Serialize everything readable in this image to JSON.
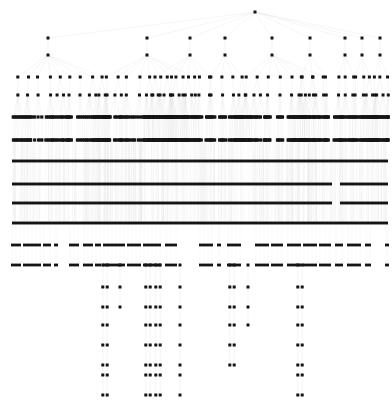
{
  "figure": {
    "type": "node-link-tree",
    "orientation": "top-down",
    "width": 392,
    "height": 407,
    "background_color": "#ffffff",
    "node_color": "#141414",
    "node_shape": "square",
    "node_size_px": 3,
    "edge_color": "#d8d8d8",
    "edge_width_px": 0.6,
    "edge_opacity": 0.55,
    "root_node": {
      "x": 255,
      "y": 12,
      "level": 0
    }
  },
  "chart_data": {
    "type": "tree",
    "xlabel": "",
    "ylabel": "",
    "grid": false,
    "legend": null,
    "level_count": 18,
    "levels": [
      {
        "index": 0,
        "y": 12,
        "node_count": 1,
        "density": "single",
        "render": "dots"
      },
      {
        "index": 1,
        "y": 38,
        "node_count": 9,
        "density": "sparse",
        "render": "dots"
      },
      {
        "index": 2,
        "y": 55,
        "node_count": 9,
        "density": "sparse",
        "render": "dots"
      },
      {
        "index": 3,
        "y": 77,
        "node_count": 30,
        "density": "sparse",
        "render": "dots"
      },
      {
        "index": 4,
        "y": 95,
        "node_count": 34,
        "density": "medium",
        "render": "dots"
      },
      {
        "index": 5,
        "y": 117,
        "node_count": 150,
        "density": "dense",
        "render": "dashes"
      },
      {
        "index": 6,
        "y": 140,
        "node_count": 150,
        "density": "dense",
        "render": "dashes"
      },
      {
        "index": 7,
        "y": 161,
        "node_count": 320,
        "density": "saturated",
        "render": "solid-band"
      },
      {
        "index": 8,
        "y": 184,
        "node_count": 320,
        "density": "saturated",
        "render": "solid-band"
      },
      {
        "index": 9,
        "y": 203,
        "node_count": 320,
        "density": "saturated",
        "render": "solid-band"
      },
      {
        "index": 10,
        "y": 223,
        "node_count": 320,
        "density": "saturated",
        "render": "solid-band"
      },
      {
        "index": 11,
        "y": 245,
        "node_count": 90,
        "density": "medium",
        "render": "dashes"
      },
      {
        "index": 12,
        "y": 265,
        "node_count": 90,
        "density": "medium",
        "render": "dashes"
      },
      {
        "index": 13,
        "y": 287,
        "node_count": 14,
        "density": "sparse",
        "render": "dots"
      },
      {
        "index": 14,
        "y": 307,
        "node_count": 13,
        "density": "sparse",
        "render": "dots"
      },
      {
        "index": 15,
        "y": 325,
        "node_count": 9,
        "density": "sparse",
        "render": "dots"
      },
      {
        "index": 16,
        "y": 345,
        "node_count": 9,
        "density": "sparse",
        "render": "dots"
      },
      {
        "index": 17,
        "y": 365,
        "node_count": 9,
        "density": "sparse",
        "render": "dots"
      },
      {
        "index": 18,
        "y": 375,
        "node_count": 8,
        "density": "sparse",
        "render": "dots"
      },
      {
        "index": 19,
        "y": 395,
        "node_count": 8,
        "density": "sparse",
        "render": "dots"
      }
    ],
    "level1_nodes_x": [
      48,
      147,
      225,
      272,
      345,
      362,
      380,
      310,
      190
    ],
    "level2_nodes_x": [
      48,
      147,
      225,
      272,
      345,
      362,
      380,
      310,
      190
    ],
    "level3_nodes_x": [
      12,
      25,
      35,
      48,
      63,
      70,
      80,
      92,
      100,
      120,
      130,
      147,
      158,
      170,
      182,
      193,
      205,
      213,
      220,
      225,
      230,
      240,
      252,
      262,
      272,
      285,
      300,
      312,
      325,
      337,
      345,
      352,
      362,
      370,
      380,
      388
    ],
    "level4_nodes_x": [
      12,
      22,
      32,
      42,
      52,
      62,
      72,
      82,
      92,
      102,
      112,
      124,
      136,
      148,
      160,
      172,
      184,
      196,
      208,
      218,
      226,
      234,
      244,
      256,
      268,
      280,
      292,
      304,
      316,
      328,
      340,
      348,
      356,
      364,
      372,
      380,
      388
    ],
    "dense_band_x_start": 12,
    "dense_band_x_end": 388,
    "solid_band_gap": {
      "x_start": 332,
      "x_end": 340,
      "applies_to_levels": [
        8,
        9
      ]
    },
    "bottom_chain_columns_x": [
      105,
      120,
      148,
      158,
      180,
      232,
      248,
      300
    ],
    "deep_chain_columns_x": [
      105,
      148,
      158,
      180,
      232,
      300
    ],
    "final_chain_columns_x": [
      105,
      148,
      158,
      180,
      232,
      300
    ]
  }
}
